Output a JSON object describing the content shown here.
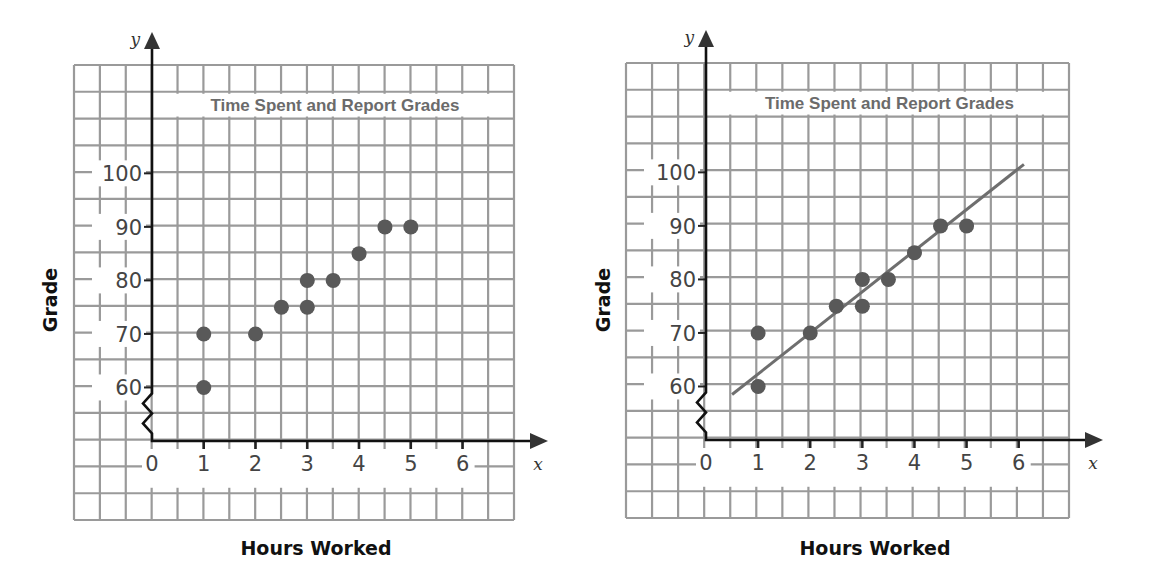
{
  "chart_data": [
    {
      "type": "scatter",
      "panel": "left",
      "title": "Time Spent and Report Grades",
      "xlabel": "Hours Worked",
      "ylabel": "Grade",
      "x_axis_letter": "x",
      "y_axis_letter": "y",
      "x_ticks": [
        "0",
        "1",
        "2",
        "3",
        "4",
        "5",
        "6"
      ],
      "y_ticks": [
        "60",
        "70",
        "80",
        "90",
        "100"
      ],
      "xlim": [
        0,
        6
      ],
      "ylim": [
        60,
        100
      ],
      "y_axis_break": true,
      "grid": true,
      "points": [
        {
          "x": 1,
          "y": 60
        },
        {
          "x": 1,
          "y": 70
        },
        {
          "x": 2,
          "y": 70
        },
        {
          "x": 2.5,
          "y": 75
        },
        {
          "x": 3,
          "y": 75
        },
        {
          "x": 3,
          "y": 80
        },
        {
          "x": 3.5,
          "y": 80
        },
        {
          "x": 4,
          "y": 85
        },
        {
          "x": 4.5,
          "y": 90
        },
        {
          "x": 5,
          "y": 90
        }
      ],
      "trend_line": null,
      "colors": {
        "points": "#595959",
        "grid": "#9a9a9a",
        "axis": "#111111",
        "title": "#6b6b6b"
      }
    },
    {
      "type": "scatter",
      "panel": "right",
      "title": "Time Spent and Report Grades",
      "xlabel": "Hours Worked",
      "ylabel": "Grade",
      "x_axis_letter": "x",
      "y_axis_letter": "y",
      "x_ticks": [
        "0",
        "1",
        "2",
        "3",
        "4",
        "5",
        "6"
      ],
      "y_ticks": [
        "60",
        "70",
        "80",
        "90",
        "100"
      ],
      "xlim": [
        0,
        6
      ],
      "ylim": [
        60,
        100
      ],
      "y_axis_break": true,
      "grid": true,
      "points": [
        {
          "x": 1,
          "y": 60
        },
        {
          "x": 1,
          "y": 70
        },
        {
          "x": 2,
          "y": 70
        },
        {
          "x": 2.5,
          "y": 75
        },
        {
          "x": 3,
          "y": 75
        },
        {
          "x": 3,
          "y": 80
        },
        {
          "x": 3.5,
          "y": 80
        },
        {
          "x": 4,
          "y": 85
        },
        {
          "x": 4.5,
          "y": 90
        },
        {
          "x": 5,
          "y": 90
        }
      ],
      "trend_line": {
        "x1": 0.5,
        "y1": 58.5,
        "x2": 6.1,
        "y2": 101.5
      },
      "colors": {
        "points": "#595959",
        "grid": "#9a9a9a",
        "axis": "#111111",
        "title": "#6b6b6b",
        "trend_line": "#6e6e6e"
      }
    }
  ]
}
